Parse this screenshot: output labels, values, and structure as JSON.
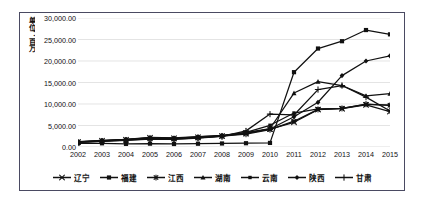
{
  "chart_data": {
    "type": "line",
    "title": "",
    "xlabel": "",
    "ylabel": "单位：百万",
    "x": [
      "2002",
      "2003",
      "2004",
      "2005",
      "2006",
      "2007",
      "2008",
      "2009",
      "2010",
      "2011",
      "2012",
      "2013",
      "2014",
      "2015"
    ],
    "categories": [
      "2002",
      "2003",
      "2004",
      "2005",
      "2006",
      "2007",
      "2008",
      "2009",
      "2010",
      "2011",
      "2012",
      "2013",
      "2014",
      "2015"
    ],
    "ylim": [
      0,
      30000
    ],
    "ytick_labels": [
      "0.00",
      "5,000.00",
      "10,000.00",
      "15,000.00",
      "20,000.00",
      "25,000.00",
      "30,000.00"
    ],
    "ytick_values": [
      0,
      5000,
      10000,
      15000,
      20000,
      25000,
      30000
    ],
    "grid": true,
    "grid_axis": "y",
    "legend_position": "bottom",
    "line_color": "#111111",
    "grid_color": "#d9d9d9",
    "series": [
      {
        "name": "辽宁",
        "marker": "cross",
        "values": [
          1150,
          1450,
          1700,
          2150,
          2050,
          2250,
          2550,
          3150,
          4150,
          5750,
          8700,
          8900,
          9800,
          8250
        ]
      },
      {
        "name": "福建",
        "marker": "square",
        "values": [
          820,
          860,
          720,
          780,
          700,
          760,
          820,
          880,
          950,
          17400,
          22900,
          24600,
          27200,
          26200
        ]
      },
      {
        "name": "江西",
        "marker": "star",
        "values": [
          1100,
          1350,
          1600,
          1900,
          1850,
          2100,
          2500,
          3000,
          4050,
          6000,
          8750,
          9000,
          9950,
          9700
        ]
      },
      {
        "name": "湖南",
        "marker": "triangle",
        "values": [
          1250,
          1550,
          1800,
          2250,
          2150,
          2400,
          2700,
          3350,
          4300,
          12550,
          15200,
          14300,
          11900,
          12400
        ]
      },
      {
        "name": "云南",
        "marker": "square-small",
        "values": [
          1200,
          1400,
          1650,
          2000,
          1950,
          2200,
          2600,
          3400,
          5050,
          7900,
          8850,
          9000,
          9900,
          9750
        ]
      },
      {
        "name": "陕西",
        "marker": "diamond",
        "values": [
          1180,
          1500,
          1750,
          2100,
          2000,
          2350,
          2650,
          3250,
          4200,
          7050,
          10400,
          16600,
          20000,
          21200
        ]
      },
      {
        "name": "甘肃",
        "marker": "plus",
        "values": [
          1050,
          1300,
          1550,
          1850,
          1800,
          2050,
          2450,
          3750,
          7650,
          7450,
          13350,
          14300,
          11600,
          8400
        ]
      }
    ]
  },
  "legend": {
    "items": [
      {
        "label": "辽宁"
      },
      {
        "label": "福建"
      },
      {
        "label": "江西"
      },
      {
        "label": "湖南"
      },
      {
        "label": "云南"
      },
      {
        "label": "陕西"
      },
      {
        "label": "甘肃"
      }
    ]
  }
}
